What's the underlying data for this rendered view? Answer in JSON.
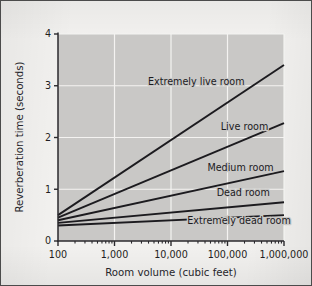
{
  "chart_data": {
    "type": "line",
    "title": "",
    "subtitle": "",
    "xlabel": "Room volume (cubic feet)",
    "ylabel": "Reverberation time (seconds)",
    "xscale": "log",
    "yscale": "linear",
    "xlim": [
      100,
      1000000
    ],
    "ylim": [
      0,
      4
    ],
    "grid": true,
    "legend_position": "inline-labels",
    "x_tick_labels": [
      "100",
      "1,000",
      "10,000",
      "100,000",
      "1,000,000"
    ],
    "x_tick_values": [
      100,
      1000,
      10000,
      100000,
      1000000
    ],
    "y_tick_labels": [
      "0",
      "1",
      "2",
      "3",
      "4"
    ],
    "y_tick_values": [
      0,
      1,
      2,
      3,
      4
    ],
    "x": [
      100,
      1000000
    ],
    "series": [
      {
        "name": "Extremely live room",
        "values": [
          0.5,
          3.4
        ]
      },
      {
        "name": "Live room",
        "values": [
          0.45,
          2.28
        ]
      },
      {
        "name": "Medium room",
        "values": [
          0.4,
          1.35
        ]
      },
      {
        "name": "Dead room",
        "values": [
          0.35,
          0.75
        ]
      },
      {
        "name": "Extremely dead room",
        "values": [
          0.3,
          0.5
        ]
      }
    ],
    "annotations": [
      {
        "text": "Extremely live room",
        "x": 28000,
        "y": 3.02
      },
      {
        "text": "Live room",
        "x": 200000,
        "y": 2.14
      },
      {
        "text": "Medium room",
        "x": 170000,
        "y": 1.36
      },
      {
        "text": "Dead room",
        "x": 190000,
        "y": 0.87
      },
      {
        "text": "Extremely dead room",
        "x": 160000,
        "y": 0.33
      }
    ],
    "colors": {
      "plot_background": "#c9c8c6",
      "grid": "#f4f3f1",
      "line": "#1c1b1f",
      "axis": "#2a292d",
      "figure_background": "#f2f1ef",
      "text": "#1f1e22"
    }
  }
}
